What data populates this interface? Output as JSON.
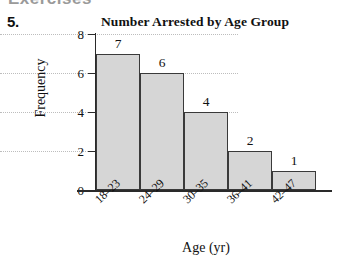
{
  "page": {
    "top_remnant_text": "Exercises",
    "problem_number": "5."
  },
  "chart_data": {
    "type": "bar",
    "title": "Number Arrested by Age Group",
    "xlabel": "Age (yr)",
    "ylabel": "Frequency",
    "categories": [
      "18–23",
      "24–29",
      "30–35",
      "36–41",
      "42–47"
    ],
    "values": [
      7,
      6,
      4,
      2,
      1
    ],
    "value_labels": [
      "7",
      "6",
      "4",
      "2",
      "1"
    ],
    "ylim": [
      0,
      8
    ],
    "ytick_labels": [
      "0",
      "2",
      "4",
      "6",
      "8"
    ],
    "ytick_values": [
      0,
      2,
      4,
      6,
      8
    ],
    "grid": "horizontal-dotted",
    "legend": "none",
    "bar_fill_color": "#d6d6d6",
    "bar_edge_color": "#3a3a3a",
    "axis_color": "#2a2a2a",
    "gridline_color": "#bdbdbd",
    "background_color": "#ffffff"
  }
}
